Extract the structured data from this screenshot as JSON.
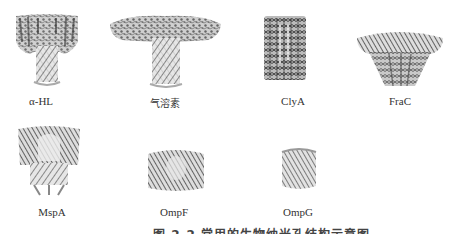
{
  "figure": {
    "panels": [
      {
        "id": "alpha-hl",
        "label": "α-HL"
      },
      {
        "id": "aerolysin",
        "label": "气溶素"
      },
      {
        "id": "clya",
        "label": "ClyA"
      },
      {
        "id": "frac",
        "label": "FraC"
      },
      {
        "id": "mspa",
        "label": "MspA"
      },
      {
        "id": "ompf",
        "label": "OmpF"
      },
      {
        "id": "ompg",
        "label": "OmpG"
      }
    ],
    "caption": "图 2-2  常用的生物纳米孔结构示意图"
  }
}
